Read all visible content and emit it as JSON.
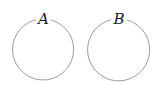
{
  "diagram": {
    "circles": [
      {
        "label": "A",
        "cx": 43.5,
        "cy": 50,
        "r": 30.5
      },
      {
        "label": "B",
        "cx": 119,
        "cy": 50,
        "r": 31
      }
    ],
    "stroke_color": "#9a9a9a"
  }
}
